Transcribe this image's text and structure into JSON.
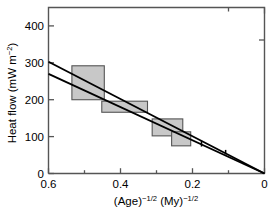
{
  "chart_data": {
    "type": "scatter",
    "title": "",
    "xlabel": "(Age)⁻¹ᐟ² (My)⁻¹ᐟ²",
    "ylabel": "Heat flow (mW m⁻²)",
    "xlabel_parts": {
      "age_base": "(Age)",
      "age_exp_minus": "−",
      "age_exp_num": "1/2",
      "my_base": " (My)",
      "my_exp_minus": "−",
      "my_exp_num": "1/2"
    },
    "ylabel_parts": {
      "base": "Heat flow  (mW m",
      "exp_minus": "−",
      "exp_num": "2",
      "close": ")"
    },
    "xlim": [
      0.6,
      0.0
    ],
    "ylim": [
      0,
      450
    ],
    "x_reversed": true,
    "xticks": [
      0.6,
      0.4,
      0.2,
      0.0
    ],
    "xticklabels": [
      "0.6",
      "0.4",
      "0.2",
      "0"
    ],
    "x_minor_ticks": [
      0.5,
      0.3,
      0.1
    ],
    "yticks": [
      0,
      100,
      200,
      300,
      400
    ],
    "yticklabels": [
      "0",
      "100",
      "200",
      "300",
      "400"
    ],
    "grid": false,
    "legend": null,
    "box_color": "#c8c8c8",
    "box_edge_color": "#555555",
    "line_color": "#000000",
    "axis_color": "#444444",
    "boxes": [
      {
        "name": "box-1",
        "x_min": 0.445,
        "x_max": 0.535,
        "y_min": 200,
        "y_max": 292
      },
      {
        "name": "box-2",
        "x_min": 0.325,
        "x_max": 0.452,
        "y_min": 166,
        "y_max": 196
      },
      {
        "name": "box-3",
        "x_min": 0.227,
        "x_max": 0.312,
        "y_min": 102,
        "y_max": 148
      },
      {
        "name": "box-4",
        "x_min": 0.205,
        "x_max": 0.258,
        "y_min": 75,
        "y_max": 113
      }
    ],
    "points": [
      {
        "name": "point-1",
        "x": 0.175,
        "y": 81,
        "yerr": 8
      },
      {
        "name": "point-2",
        "x": 0.108,
        "y": 58,
        "yerr": 6
      }
    ],
    "series": [
      {
        "name": "fit-line-upper",
        "type": "line",
        "x": [
          0.6,
          0.0
        ],
        "values": [
          303,
          0
        ],
        "intercept": 0,
        "slope": 505
      },
      {
        "name": "fit-line-lower",
        "type": "line",
        "x": [
          0.6,
          0.0
        ],
        "values": [
          270,
          0
        ],
        "intercept": 0,
        "slope": 450
      }
    ]
  }
}
